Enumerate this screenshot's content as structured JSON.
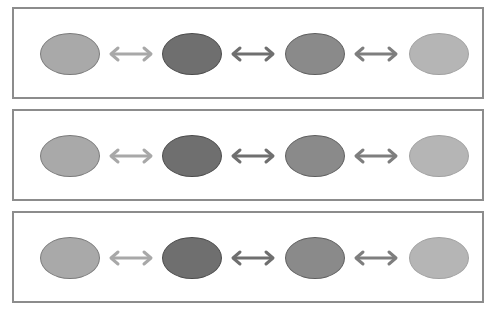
{
  "diagram": {
    "panels": [
      {
        "id": "row-1",
        "nodes": [
          {
            "fill": "#a9a9a9",
            "stroke": "#7a7a7a"
          },
          {
            "fill": "#6f6f6f",
            "stroke": "#4a4a4a"
          },
          {
            "fill": "#8a8a8a",
            "stroke": "#5e5e5e"
          },
          {
            "fill": "#b5b5b5",
            "stroke": "#a0a0a0"
          }
        ],
        "arrows": [
          {
            "color": "#a8a8a8",
            "direction": "bidirectional"
          },
          {
            "color": "#6f6f6f",
            "direction": "bidirectional"
          },
          {
            "color": "#7e7e7e",
            "direction": "bidirectional"
          }
        ]
      },
      {
        "id": "row-2",
        "nodes": [
          {
            "fill": "#a9a9a9",
            "stroke": "#7a7a7a"
          },
          {
            "fill": "#6f6f6f",
            "stroke": "#4a4a4a"
          },
          {
            "fill": "#8a8a8a",
            "stroke": "#5e5e5e"
          },
          {
            "fill": "#b5b5b5",
            "stroke": "#a0a0a0"
          }
        ],
        "arrows": [
          {
            "color": "#a8a8a8",
            "direction": "bidirectional"
          },
          {
            "color": "#6f6f6f",
            "direction": "bidirectional"
          },
          {
            "color": "#7e7e7e",
            "direction": "bidirectional"
          }
        ]
      },
      {
        "id": "row-3",
        "nodes": [
          {
            "fill": "#a9a9a9",
            "stroke": "#7a7a7a"
          },
          {
            "fill": "#6f6f6f",
            "stroke": "#4a4a4a"
          },
          {
            "fill": "#8a8a8a",
            "stroke": "#5e5e5e"
          },
          {
            "fill": "#b5b5b5",
            "stroke": "#a0a0a0"
          }
        ],
        "arrows": [
          {
            "color": "#a8a8a8",
            "direction": "bidirectional"
          },
          {
            "color": "#6f6f6f",
            "direction": "bidirectional"
          },
          {
            "color": "#7e7e7e",
            "direction": "bidirectional"
          }
        ]
      }
    ],
    "colors": {
      "panel_border": "#8c8c8c",
      "background": "#ffffff"
    }
  }
}
